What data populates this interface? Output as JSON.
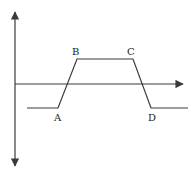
{
  "diagram": {
    "type": "trapezoidal waveform on axes",
    "colors": {
      "line": "#3a3a3a",
      "text": "#222222",
      "background": "#ffffff"
    },
    "labels": {
      "A": "A",
      "B": "B",
      "C": "C",
      "D": "D"
    },
    "points": {
      "A": [
        58,
        108
      ],
      "B": [
        77,
        59
      ],
      "C": [
        133,
        59
      ],
      "D": [
        151,
        108
      ]
    }
  }
}
